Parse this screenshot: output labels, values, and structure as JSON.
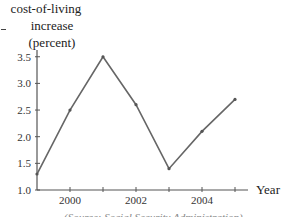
{
  "chart_data": {
    "type": "line",
    "title": "",
    "ylabel": [
      "cost-of-living",
      "increase",
      "(percent)"
    ],
    "xlabel": "Year",
    "x": [
      1999,
      2000,
      2001,
      2002,
      2003,
      2004,
      2005
    ],
    "series": [
      {
        "name": "cost-of-living increase",
        "values": [
          1.3,
          2.5,
          3.5,
          2.6,
          1.4,
          2.1,
          2.7
        ]
      }
    ],
    "x_tick_labels": [
      "2000",
      "2002",
      "2004"
    ],
    "y_ticks": [
      1.0,
      1.5,
      2.0,
      2.5,
      3.0,
      3.5
    ],
    "y_tick_labels": [
      "1.0",
      "1.5",
      "2.0",
      "2.5",
      "3.0",
      "3.5"
    ],
    "ylim": [
      1.0,
      3.5
    ],
    "xlim": [
      1999,
      2005
    ],
    "grid": false,
    "legend": null,
    "line_color": "#666666"
  },
  "caption": "(Source: Social Security Administration)"
}
